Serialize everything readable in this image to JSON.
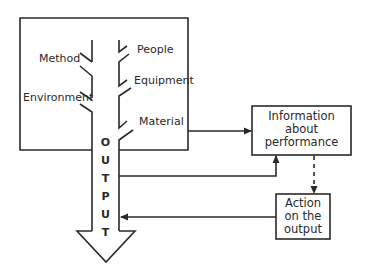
{
  "diagram": {
    "type": "flow-control-loop",
    "process_box": {
      "inputs_left": [
        "Method",
        "Environment"
      ],
      "inputs_right": [
        "People",
        "Equipment",
        "Material"
      ]
    },
    "output_arrow": {
      "letters": [
        "O",
        "U",
        "T",
        "P",
        "U",
        "T"
      ]
    },
    "info_box": {
      "lines": [
        "Information",
        "about",
        "performance"
      ]
    },
    "action_box": {
      "lines": [
        "Action",
        "on the",
        "output"
      ]
    },
    "colors": {
      "stroke": "#2a2a2a",
      "background": "#ffffff"
    }
  }
}
